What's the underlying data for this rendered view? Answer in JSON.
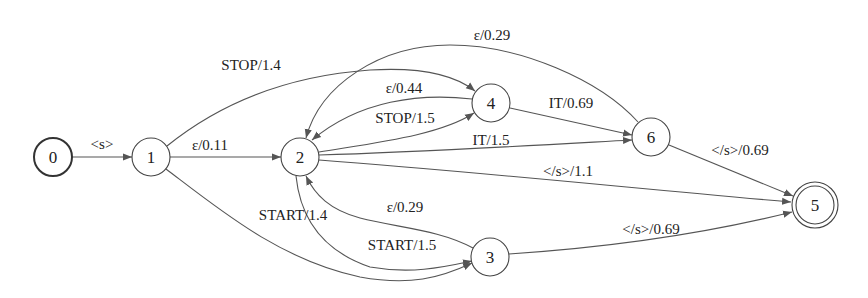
{
  "diagram": {
    "type": "weighted finite-state automaton",
    "nodes": [
      {
        "id": "0",
        "label": "0",
        "x": 53,
        "y": 157,
        "initial": true,
        "final": false
      },
      {
        "id": "1",
        "label": "1",
        "x": 151,
        "y": 157,
        "initial": false,
        "final": false
      },
      {
        "id": "2",
        "label": "2",
        "x": 300,
        "y": 157,
        "initial": false,
        "final": false
      },
      {
        "id": "3",
        "label": "3",
        "x": 490,
        "y": 257,
        "initial": false,
        "final": false
      },
      {
        "id": "4",
        "label": "4",
        "x": 491,
        "y": 103,
        "initial": false,
        "final": false
      },
      {
        "id": "6",
        "label": "6",
        "x": 651,
        "y": 137,
        "initial": false,
        "final": false
      },
      {
        "id": "5",
        "label": "5",
        "x": 815,
        "y": 205,
        "initial": false,
        "final": true
      }
    ],
    "edges": [
      {
        "from": "0",
        "to": "1",
        "label": "<s>"
      },
      {
        "from": "1",
        "to": "2",
        "label": "ε/0.11"
      },
      {
        "from": "1",
        "to": "4",
        "label": "STOP/1.4"
      },
      {
        "from": "1",
        "to": "3",
        "label": "START/1.4"
      },
      {
        "from": "4",
        "to": "2",
        "label": "ε/0.44"
      },
      {
        "from": "2",
        "to": "4",
        "label": "STOP/1.5"
      },
      {
        "from": "6",
        "to": "2",
        "label": "ε/0.29"
      },
      {
        "from": "4",
        "to": "6",
        "label": "IT/0.69"
      },
      {
        "from": "2",
        "to": "6",
        "label": "IT/1.5"
      },
      {
        "from": "2",
        "to": "5",
        "label": "</s>/1.1"
      },
      {
        "from": "6",
        "to": "5",
        "label": "</s>/0.69"
      },
      {
        "from": "3",
        "to": "2",
        "label": "ε/0.29"
      },
      {
        "from": "2",
        "to": "3",
        "label": "START/1.5"
      },
      {
        "from": "3",
        "to": "5",
        "label": "</s>/0.69"
      }
    ]
  },
  "labels": {
    "n0": "0",
    "n1": "1",
    "n2": "2",
    "n3": "3",
    "n4": "4",
    "n5": "5",
    "n6": "6",
    "e_0_1": "<s>",
    "e_1_2": "ε/0.11",
    "e_1_4": "STOP/1.4",
    "e_1_3": "START/1.4",
    "e_4_2": "ε/0.44",
    "e_2_4": "STOP/1.5",
    "e_6_2": "ε/0.29",
    "e_4_6": "IT/0.69",
    "e_2_6": "IT/1.5",
    "e_2_5": "</s>/1.1",
    "e_6_5": "</s>/0.69",
    "e_3_2": "ε/0.29",
    "e_2_3": "START/1.5",
    "e_3_5": "</s>/0.69"
  }
}
